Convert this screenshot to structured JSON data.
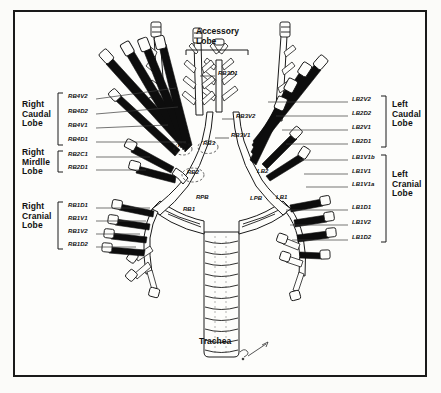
{
  "figure": {
    "signature": "sig"
  },
  "lobes": {
    "right_caudal": "Right\nCaudal\nLobe",
    "right_middle": "Right\nMirdlle\nLobe",
    "right_cranial": "Right\nCranial\nLobe",
    "left_caudal": "Left\nCaudal\nLobe",
    "left_cranial": "Left\nCranial\nLobe",
    "accessory": "Accessory\nLobe"
  },
  "trachea_label": "Trachea",
  "left_segments": [
    {
      "id": "rb4v2",
      "label": "RB4V2",
      "x": 68,
      "y": 97,
      "leader_x2": 168,
      "leader_y2": 83
    },
    {
      "id": "rb4d2",
      "label": "RB4D2",
      "x": 68,
      "y": 112,
      "leader_x2": 178,
      "leader_y2": 103
    },
    {
      "id": "rb4v1",
      "label": "RB4V1",
      "x": 68,
      "y": 126,
      "leader_x2": 166,
      "leader_y2": 122
    },
    {
      "id": "rb4d1",
      "label": "RB4D1",
      "x": 68,
      "y": 140,
      "leader_x2": 186,
      "leader_y2": 139
    },
    {
      "id": "rb2c1",
      "label": "RB2C1",
      "x": 68,
      "y": 155,
      "leader_x2": 150,
      "leader_y2": 155
    },
    {
      "id": "rb2d1",
      "label": "RB2D1",
      "x": 68,
      "y": 168,
      "leader_x2": 148,
      "leader_y2": 168
    },
    {
      "id": "rb1d1",
      "label": "RB1D1",
      "x": 68,
      "y": 206,
      "leader_x2": 152,
      "leader_y2": 206
    },
    {
      "id": "rb1v1",
      "label": "RB1V1",
      "x": 68,
      "y": 219,
      "leader_x2": 146,
      "leader_y2": 219
    },
    {
      "id": "rb1v2",
      "label": "RB1V2",
      "x": 68,
      "y": 232,
      "leader_x2": 140,
      "leader_y2": 232
    },
    {
      "id": "rb1d2",
      "label": "RB1D2",
      "x": 68,
      "y": 245,
      "leader_x2": 136,
      "leader_y2": 245
    }
  ],
  "right_segments": [
    {
      "id": "lb2v2",
      "label": "LB2V2",
      "x": 352,
      "y": 100,
      "leader_x1": 268,
      "leader_y1": 100
    },
    {
      "id": "lb2d2",
      "label": "LB2D2",
      "x": 352,
      "y": 114,
      "leader_x1": 276,
      "leader_y1": 114
    },
    {
      "id": "lb2v1",
      "label": "LB2V1",
      "x": 352,
      "y": 128,
      "leader_x1": 282,
      "leader_y1": 128
    },
    {
      "id": "lb2d1",
      "label": "LB2D1",
      "x": 352,
      "y": 142,
      "leader_x1": 286,
      "leader_y1": 142
    },
    {
      "id": "lb1v1b",
      "label": "LB1V1b",
      "x": 352,
      "y": 158,
      "leader_x1": 300,
      "leader_y1": 158
    },
    {
      "id": "lb1v1",
      "label": "LB1V1",
      "x": 352,
      "y": 172,
      "leader_x1": 304,
      "leader_y1": 172
    },
    {
      "id": "lb1v1a",
      "label": "LB1V1a",
      "x": 352,
      "y": 185,
      "leader_x1": 306,
      "leader_y1": 185
    },
    {
      "id": "lb1d1",
      "label": "LB1D1",
      "x": 352,
      "y": 208,
      "leader_x1": 286,
      "leader_y1": 208
    },
    {
      "id": "lb1v2",
      "label": "LB1V2",
      "x": 352,
      "y": 223,
      "leader_x1": 288,
      "leader_y1": 223
    },
    {
      "id": "lb1d2",
      "label": "LB1D2",
      "x": 352,
      "y": 238,
      "leader_x1": 290,
      "leader_y1": 238
    }
  ],
  "airway_labels": [
    {
      "id": "rb3d1",
      "label": "RB3D1",
      "x": 218,
      "y": 74
    },
    {
      "id": "rb3v2",
      "label": "RB3V2",
      "x": 236,
      "y": 117
    },
    {
      "id": "rb3v1",
      "label": "RB3V1",
      "x": 231,
      "y": 136
    },
    {
      "id": "rb4",
      "label": "RB4",
      "x": 178,
      "y": 146
    },
    {
      "id": "rb3",
      "label": "RB3",
      "x": 203,
      "y": 144
    },
    {
      "id": "rb2",
      "label": "RB2",
      "x": 187,
      "y": 173
    },
    {
      "id": "rpb",
      "label": "RPB",
      "x": 196,
      "y": 198
    },
    {
      "id": "rb1",
      "label": "RB1",
      "x": 183,
      "y": 210
    },
    {
      "id": "lb2",
      "label": "LB2",
      "x": 257,
      "y": 172
    },
    {
      "id": "lpb",
      "label": "LPB",
      "x": 250,
      "y": 199
    },
    {
      "id": "lb1",
      "label": "LB1",
      "x": 276,
      "y": 198
    }
  ],
  "colors": {
    "ink": "#111111",
    "fill_black": "#0d0d0d",
    "outline": "#1a1a1a",
    "paper": "#fdfdfb",
    "leader": "#3a3a3a"
  }
}
